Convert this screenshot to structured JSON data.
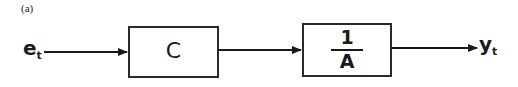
{
  "panel_label": "(a)",
  "input_signal": {
    "symbol": "e",
    "subscript": "t"
  },
  "output_signal": {
    "symbol": "y",
    "subscript": "t"
  },
  "blocks": [
    {
      "id": "controller",
      "label": "C"
    },
    {
      "id": "inverse-a",
      "numerator": "1",
      "denominator": "A"
    }
  ],
  "colors": {
    "stroke": "#2a2a2a",
    "background": "#ffffff"
  }
}
